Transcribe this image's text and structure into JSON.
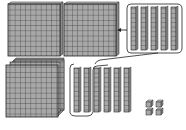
{
  "diagram": {
    "colors": {
      "block_fill": "#a8a8a8",
      "grid_line": "#3a3a3a",
      "side_fill": "#8a8a8a",
      "outline": "#222222",
      "background": "#ffffff"
    },
    "top_row": {
      "flats": [
        {
          "x": 8,
          "y": 4,
          "size": 52
        },
        {
          "x": 64,
          "y": 4,
          "size": 52
        }
      ],
      "rod_group": {
        "x": 127,
        "y": 5,
        "width": 55,
        "height": 48,
        "rod_count": 5
      },
      "arrow": {
        "from_x": 127,
        "to_x": 117,
        "y": 30,
        "direction": "left"
      }
    },
    "bottom_row": {
      "stacked_flats": {
        "x": 6,
        "y": 64,
        "size": 52,
        "stack_count": 3
      },
      "rods": {
        "count": 7,
        "grouped_count": 4
      },
      "unit_cubes": {
        "count": 4
      }
    }
  }
}
